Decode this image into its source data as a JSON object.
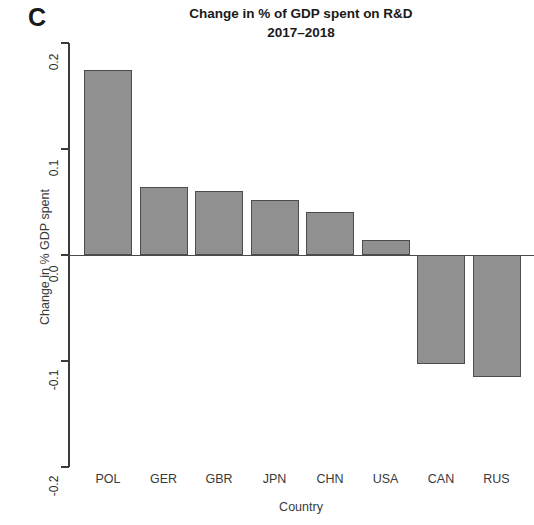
{
  "panel": {
    "label": "C"
  },
  "chart_data": {
    "type": "bar",
    "title": "Change in % of GDP spent on R&D",
    "subtitle": "2017–2018",
    "xlabel": "Country",
    "ylabel": "Change in % GDP spent",
    "categories": [
      "POL",
      "GER",
      "GBR",
      "JPN",
      "CHN",
      "USA",
      "CAN",
      "RUS"
    ],
    "values": [
      0.175,
      0.064,
      0.06,
      0.052,
      0.041,
      0.014,
      -0.103,
      -0.115
    ],
    "ylim": [
      -0.2,
      0.2
    ],
    "yticks": [
      0.2,
      0.1,
      0.0,
      -0.1,
      -0.2
    ],
    "ytick_labels": [
      "0.2",
      "0.1",
      "0.0",
      "-0.1",
      "-0.2"
    ],
    "grid": false,
    "legend": "none",
    "bar_fill": "#909090",
    "bar_border": "#4c4c4c",
    "axis_color": "#3b3b3b"
  }
}
